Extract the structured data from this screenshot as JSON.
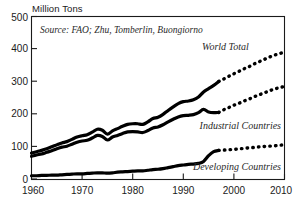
{
  "figure": {
    "axis_unit_label": "Million Tons",
    "source_note": "Source: FAO; Zhu, Tomberlin, Buongiorno"
  },
  "labels": {
    "world_total": "World Total",
    "industrial": "Industrial Countries",
    "developing": "Developing Countries"
  },
  "axes": {
    "y_ticks": [
      "0",
      "100",
      "200",
      "300",
      "400",
      "500"
    ],
    "x_ticks": [
      "1960",
      "1970",
      "1980",
      "1990",
      "2000",
      "2010"
    ]
  },
  "colors": {
    "line": "#000000",
    "frame": "#1a1a1a",
    "text": "#1a1a1a",
    "background": "#ffffff"
  },
  "chart_data": {
    "type": "line",
    "title": "",
    "subtitle": "",
    "xlabel": "",
    "ylabel": "Million Tons",
    "unit": "Million Tons",
    "annotations": [
      "Source: FAO; Zhu, Tomberlin, Buongiorno"
    ],
    "legend_position": "inline-on-series",
    "grid": false,
    "xlim": [
      1960,
      2010
    ],
    "ylim": [
      0,
      500
    ],
    "y_ticks": [
      0,
      100,
      200,
      300,
      400,
      500
    ],
    "x_ticks": [
      1960,
      1970,
      1980,
      1990,
      2000,
      2010
    ],
    "history_end_year": 1997,
    "projection_start_year": 1997,
    "series": [
      {
        "name": "World Total",
        "style": "solid-then-dotted",
        "x": [
          1960,
          1961,
          1962,
          1963,
          1964,
          1965,
          1966,
          1967,
          1968,
          1969,
          1970,
          1971,
          1972,
          1973,
          1974,
          1975,
          1976,
          1977,
          1978,
          1979,
          1980,
          1981,
          1982,
          1983,
          1984,
          1985,
          1986,
          1987,
          1988,
          1989,
          1990,
          1991,
          1992,
          1993,
          1994,
          1995,
          1996,
          1997
        ],
        "values": [
          80,
          84,
          88,
          93,
          99,
          105,
          111,
          115,
          122,
          129,
          133,
          136,
          144,
          153,
          150,
          138,
          148,
          155,
          162,
          168,
          170,
          170,
          168,
          176,
          186,
          190,
          199,
          211,
          222,
          232,
          238,
          240,
          244,
          252,
          268,
          278,
          288,
          300
        ],
        "projection_x": [
          1997,
          1998,
          1999,
          2000,
          2001,
          2002,
          2003,
          2004,
          2005,
          2006,
          2007,
          2008,
          2009,
          2010
        ],
        "projection_values": [
          300,
          308,
          316,
          324,
          331,
          339,
          346,
          354,
          361,
          368,
          375,
          381,
          386,
          390
        ]
      },
      {
        "name": "Industrial Countries",
        "style": "solid-then-dotted",
        "x": [
          1960,
          1961,
          1962,
          1963,
          1964,
          1965,
          1966,
          1967,
          1968,
          1969,
          1970,
          1971,
          1972,
          1973,
          1974,
          1975,
          1976,
          1977,
          1978,
          1979,
          1980,
          1981,
          1982,
          1983,
          1984,
          1985,
          1986,
          1987,
          1988,
          1989,
          1990,
          1991,
          1992,
          1993,
          1994,
          1995,
          1996,
          1997
        ],
        "values": [
          70,
          74,
          77,
          82,
          87,
          93,
          98,
          101,
          107,
          113,
          117,
          119,
          126,
          134,
          131,
          120,
          129,
          134,
          140,
          145,
          146,
          145,
          143,
          149,
          157,
          160,
          167,
          176,
          184,
          191,
          195,
          196,
          198,
          204,
          214,
          206,
          204,
          205
        ],
        "projection_x": [
          1997,
          1998,
          1999,
          2000,
          2001,
          2002,
          2003,
          2004,
          2005,
          2006,
          2007,
          2008,
          2009,
          2010
        ],
        "projection_values": [
          205,
          213,
          220,
          227,
          233,
          240,
          246,
          253,
          259,
          265,
          271,
          277,
          281,
          285
        ]
      },
      {
        "name": "Developing Countries",
        "style": "solid-then-dotted",
        "x": [
          1960,
          1961,
          1962,
          1963,
          1964,
          1965,
          1966,
          1967,
          1968,
          1969,
          1970,
          1971,
          1972,
          1973,
          1974,
          1975,
          1976,
          1977,
          1978,
          1979,
          1980,
          1981,
          1982,
          1983,
          1984,
          1985,
          1986,
          1987,
          1988,
          1989,
          1990,
          1991,
          1992,
          1993,
          1994,
          1995,
          1996,
          1997
        ],
        "values": [
          10,
          10,
          11,
          11,
          12,
          12,
          13,
          14,
          15,
          16,
          16,
          17,
          18,
          19,
          19,
          18,
          19,
          21,
          22,
          23,
          24,
          25,
          25,
          27,
          29,
          30,
          32,
          35,
          38,
          41,
          43,
          45,
          46,
          48,
          54,
          72,
          84,
          88
        ],
        "projection_x": [
          1997,
          1998,
          1999,
          2000,
          2001,
          2002,
          2003,
          2004,
          2005,
          2006,
          2007,
          2008,
          2009,
          2010
        ],
        "projection_values": [
          88,
          89,
          90,
          91,
          93,
          94,
          96,
          97,
          99,
          100,
          101,
          102,
          104,
          105
        ]
      }
    ]
  }
}
